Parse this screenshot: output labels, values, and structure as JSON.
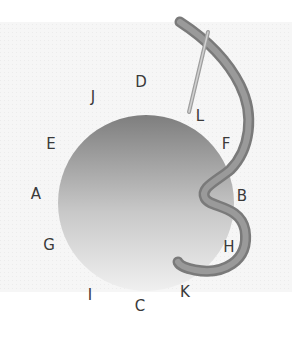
{
  "diagram": {
    "title": "",
    "colors": {
      "background": "#ffffff",
      "panel": "#f4f4f4",
      "circle_top": "#8a8a8a",
      "circle_bottom": "#e8e8e8",
      "thread": "#8c8c8c",
      "thread_shadow": "#6e6e6e",
      "needle": "#b8b8b8",
      "label": "#3a3a3a"
    },
    "labels": [
      {
        "id": "A",
        "text": "A",
        "x": 36,
        "y": 194
      },
      {
        "id": "B",
        "text": "B",
        "x": 242,
        "y": 196
      },
      {
        "id": "C",
        "text": "C",
        "x": 140,
        "y": 306
      },
      {
        "id": "D",
        "text": "D",
        "x": 141,
        "y": 82
      },
      {
        "id": "E",
        "text": "E",
        "x": 51,
        "y": 144
      },
      {
        "id": "F",
        "text": "F",
        "x": 226,
        "y": 144
      },
      {
        "id": "G",
        "text": "G",
        "x": 49,
        "y": 245
      },
      {
        "id": "H",
        "text": "H",
        "x": 229,
        "y": 247
      },
      {
        "id": "I",
        "text": "I",
        "x": 90,
        "y": 295
      },
      {
        "id": "J",
        "text": "J",
        "x": 93,
        "y": 97
      },
      {
        "id": "K",
        "text": "K",
        "x": 185,
        "y": 292
      },
      {
        "id": "L",
        "text": "L",
        "x": 200,
        "y": 116
      }
    ],
    "horizontal_bars": [
      {
        "from": "E",
        "to": "F",
        "y": 144,
        "x1": 62,
        "x2": 220
      },
      {
        "from": "A",
        "to": "B",
        "y": 194,
        "x1": 48,
        "x2": 236
      },
      {
        "from": "G",
        "to": "H",
        "y": 244,
        "x1": 62,
        "x2": 218
      }
    ],
    "vertical_bars": [
      {
        "from": "J",
        "to": "I",
        "x": 92,
        "y1": 112,
        "y2": 280
      },
      {
        "from": "D",
        "to": "C",
        "x": 138,
        "y1": 98,
        "y2": 292
      }
    ]
  }
}
